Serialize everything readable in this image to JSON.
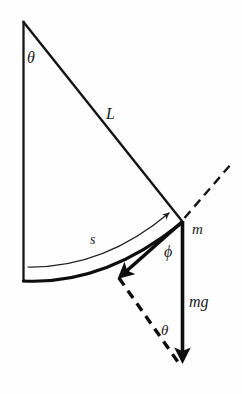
{
  "figure": {
    "background_color": "#fefefe",
    "ink_color": "#141414",
    "width": 242,
    "height": 394
  },
  "labels": {
    "theta_top": "θ",
    "length": "L",
    "arc": "s",
    "mass": "m",
    "phi": "ϕ",
    "weight": "mg",
    "theta_bottom": "θ"
  },
  "geometry": {
    "pivot": {
      "x": 23,
      "y": 22
    },
    "vertical_bottom": {
      "x": 23,
      "y": 280
    },
    "bob": {
      "x": 182,
      "y": 221
    },
    "radial_dash_end": {
      "x": 232,
      "y": 163
    },
    "tension_arrow_tip": {
      "x": 118,
      "y": 277
    },
    "weight_arrow_tip": {
      "x": 182,
      "y": 366
    },
    "arc_start": {
      "x": 28,
      "y": 266
    },
    "arc_end": {
      "x": 172,
      "y": 212
    },
    "swing_arc_start": {
      "x": 23,
      "y": 280
    },
    "swing_arc_end": {
      "x": 179,
      "y": 224
    }
  },
  "label_positions": {
    "theta_top": {
      "x": 27,
      "y": 63
    },
    "length": {
      "x": 106,
      "y": 119
    },
    "arc": {
      "x": 90,
      "y": 244
    },
    "mass": {
      "x": 192,
      "y": 234
    },
    "phi": {
      "x": 164,
      "y": 257
    },
    "weight": {
      "x": 189,
      "y": 307
    },
    "theta_bottom": {
      "x": 161,
      "y": 335
    }
  },
  "elements": {
    "string_name": "pendulum-string",
    "vertical_name": "vertical-reference-line",
    "dashed_radial_name": "radial-extension-dashed-line",
    "arc_name": "arc-length-s",
    "swing_arc_name": "swing-path-arc",
    "tension_vector_name": "tangential-force-vector",
    "weight_vector_name": "weight-vector-mg",
    "dashed_component_name": "normal-component-dashed-vector"
  }
}
